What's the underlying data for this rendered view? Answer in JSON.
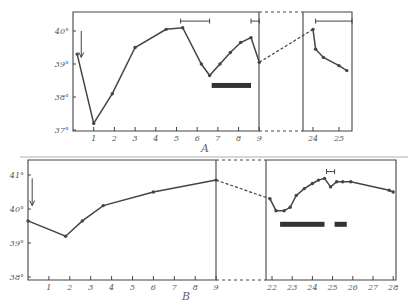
{
  "chart_data": [
    {
      "type": "line",
      "title": "",
      "caption": "A",
      "xlabel": "",
      "ylabel": "",
      "y_ticks": [
        "37°",
        "38°",
        "39°",
        "40°"
      ],
      "ylim": [
        37,
        40.3
      ],
      "x_ticks_left": [
        "1",
        "2",
        "3",
        "4",
        "5",
        "6",
        "7",
        "8",
        "9"
      ],
      "x_ticks_right": [
        "24",
        "25"
      ],
      "grid": false,
      "series": [
        {
          "name": "temperature",
          "x": [
            0.2,
            1,
            1.9,
            3,
            4.5,
            5.3,
            6.2,
            6.6,
            7.1,
            7.6,
            8.1,
            8.6,
            9
          ],
          "values": [
            39.3,
            37.2,
            38.1,
            39.5,
            40.05,
            40.1,
            39.0,
            38.65,
            39.0,
            39.35,
            39.65,
            39.8,
            39.05
          ]
        },
        {
          "name": "temperature-late",
          "x": [
            24,
            24.1,
            24.4,
            25.0,
            25.3
          ],
          "values": [
            40.05,
            39.45,
            39.2,
            38.95,
            38.8
          ]
        }
      ],
      "annotations": [
        {
          "type": "down-arrow",
          "x": 0.4,
          "y_from": 40,
          "y_to": 39.2
        },
        {
          "type": "interval-bracket",
          "x_from": 5.2,
          "x_to": 6.6,
          "y": 40.3
        },
        {
          "type": "interval-bracket",
          "x_from": 8.6,
          "x_to": 9,
          "y": 40.3
        },
        {
          "type": "interval-bracket",
          "x_from": 24.1,
          "x_to": 25.5,
          "y": 40.3
        },
        {
          "type": "thick-bar",
          "x_from": 6.7,
          "x_to": 8.6,
          "y": 38.35
        }
      ],
      "break": {
        "from": 9,
        "to": 24,
        "style": "dashed"
      }
    },
    {
      "type": "line",
      "title": "",
      "caption": "B",
      "xlabel": "",
      "ylabel": "",
      "y_ticks": [
        "38°",
        "39°",
        "40°",
        "41°"
      ],
      "ylim": [
        38,
        41.4
      ],
      "x_ticks_left": [
        "1",
        "2",
        "3",
        "4",
        "5",
        "6",
        "7",
        "8",
        "9"
      ],
      "x_ticks_right": [
        "22",
        "23",
        "24",
        "25",
        "26",
        "27",
        "28"
      ],
      "grid": false,
      "series": [
        {
          "name": "temperature",
          "x": [
            0,
            1.8,
            2.6,
            3.6,
            6.0,
            9.0
          ],
          "values": [
            39.65,
            39.2,
            39.65,
            40.1,
            40.5,
            40.85
          ]
        },
        {
          "name": "temperature-late",
          "x": [
            21.9,
            22.2,
            22.6,
            22.9,
            23.2,
            23.6,
            24.0,
            24.3,
            24.6,
            24.9,
            25.2,
            25.5,
            25.9,
            27.8,
            28
          ],
          "values": [
            40.3,
            39.95,
            39.95,
            40.05,
            40.4,
            40.6,
            40.75,
            40.85,
            40.9,
            40.65,
            40.8,
            40.8,
            40.8,
            40.55,
            40.5
          ]
        }
      ],
      "annotations": [
        {
          "type": "down-arrow",
          "x": 0.2,
          "y_from": 40.9,
          "y_to": 40.1
        },
        {
          "type": "interval-bracket",
          "x_from": 24.7,
          "x_to": 25.1,
          "y": 41.1
        },
        {
          "type": "thick-bar",
          "x_from": 22.4,
          "x_to": 24.6,
          "y": 39.55
        },
        {
          "type": "thick-bar",
          "x_from": 25.1,
          "x_to": 25.7,
          "y": 39.55
        }
      ],
      "break": {
        "from": 9,
        "to": 22,
        "style": "dashed"
      }
    }
  ]
}
